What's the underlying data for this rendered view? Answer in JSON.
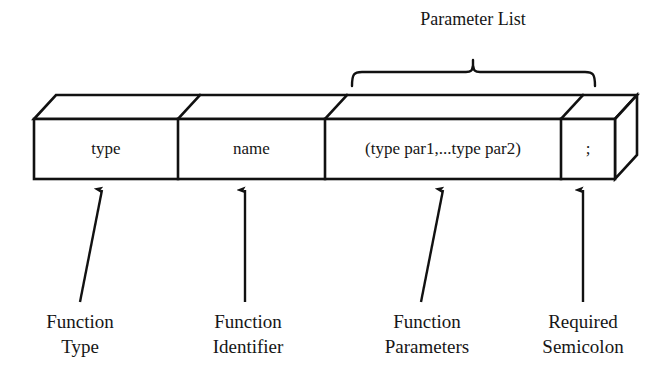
{
  "diagram": {
    "title_text": "C function prototype structure",
    "background_color": "#ffffff",
    "line_color": "#111111",
    "text_color": "#161616",
    "brace_label": {
      "line1": "Parameter",
      "line2": "List"
    },
    "box_cells": [
      {
        "id": "type-cell",
        "text": "type"
      },
      {
        "id": "name-cell",
        "text": "name"
      },
      {
        "id": "parameters-cell",
        "text": "(type par1,...type par2)"
      },
      {
        "id": "semicolon-cell",
        "text": ";"
      }
    ],
    "callouts": [
      {
        "id": "function-type",
        "line1": "Function",
        "line2": "Type"
      },
      {
        "id": "function-identifier",
        "line1": "Function",
        "line2": "Identifier"
      },
      {
        "id": "function-parameters",
        "line1": "Function",
        "line2": "Parameters"
      },
      {
        "id": "required-semicolon",
        "line1": "Required",
        "line2": "Semicolon"
      }
    ]
  }
}
